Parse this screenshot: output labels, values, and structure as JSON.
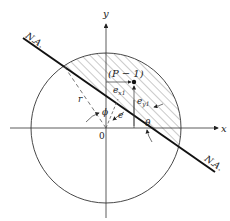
{
  "diagram": {
    "labels": {
      "y_axis": "y",
      "x_axis": "x",
      "origin": "0",
      "na_top": "N.A.",
      "na_bottom": "N.A.",
      "point": "(P − 1)",
      "ex1": "e",
      "ex1_sub": "x1",
      "ey1": "e",
      "ey1_sub": "y1",
      "r": "r",
      "phi": "ϕ",
      "e": "e",
      "theta": "θ"
    },
    "colors": {
      "line": "#1a1a1a",
      "thin": "#333333",
      "hatch": "#555555",
      "background": "#ffffff"
    }
  }
}
